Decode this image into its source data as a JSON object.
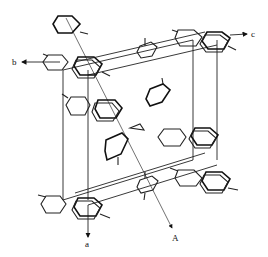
{
  "diagram": {
    "type": "crystal-structure-projection",
    "axes": [
      {
        "id": "b",
        "label": "b"
      },
      {
        "id": "c",
        "label": "c"
      },
      {
        "id": "a",
        "label": "a"
      },
      {
        "id": "A",
        "label": "A"
      }
    ],
    "colors": {
      "line": "#222222",
      "background": "#ffffff"
    }
  }
}
